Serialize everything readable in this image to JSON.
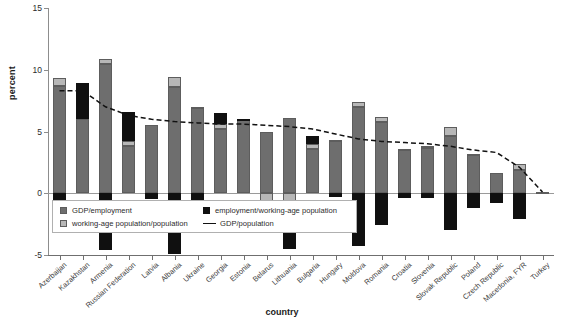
{
  "chart_data": {
    "type": "bar",
    "title": "",
    "subtitle": "",
    "xlabel": "country",
    "ylabel": "percent",
    "ylim": [
      -5,
      15
    ],
    "yticks": [
      -5,
      0,
      5,
      10,
      15
    ],
    "ytick_labels": [
      "-5",
      "0",
      "5",
      "10",
      "15"
    ],
    "grid": false,
    "stacked": true,
    "legend_position": "inside-lower-left",
    "categories": [
      "Azerbaijan",
      "Kazakhstan",
      "Armenia",
      "Russian Federation",
      "Latvia",
      "Albania",
      "Ukraine",
      "Georgia",
      "Estonia",
      "Belarus",
      "Lithuania",
      "Bulgaria",
      "Hungary",
      "Moldova",
      "Romania",
      "Croatia",
      "Slovenia",
      "Slovak Republic",
      "Poland",
      "Czech Republic",
      "Macedonia, FYR",
      "Turkey"
    ],
    "series": [
      {
        "name": "GDP/employment",
        "color": "#6e6e6e",
        "values": [
          8.7,
          6.0,
          10.5,
          3.8,
          5.5,
          8.6,
          6.9,
          5.2,
          5.9,
          5.0,
          6.1,
          3.6,
          4.2,
          7.0,
          5.8,
          3.5,
          3.7,
          4.6,
          3.1,
          1.6,
          1.9,
          0.0
        ]
      },
      {
        "name": "working-age population/population",
        "color": "#b7b7b7",
        "values": [
          0.6,
          0.0,
          0.4,
          0.4,
          0.0,
          0.8,
          0.1,
          0.4,
          0.0,
          -0.9,
          -0.6,
          0.4,
          0.1,
          0.4,
          0.4,
          0.1,
          0.1,
          0.8,
          0.1,
          0.0,
          0.5,
          0.1
        ]
      },
      {
        "name": "employment/working-age population",
        "color": "#101010",
        "values": [
          -1.3,
          2.9,
          -4.6,
          2.4,
          -0.5,
          -4.9,
          -2.8,
          0.9,
          0.1,
          -1.2,
          -3.9,
          0.6,
          -0.3,
          -4.3,
          -2.6,
          -0.4,
          -0.4,
          -3.0,
          -1.2,
          -0.8,
          -2.1,
          0.0
        ]
      }
    ],
    "line_series": {
      "name": "GDP/population",
      "color": "#111111",
      "style": "dashed",
      "values": [
        8.3,
        8.3,
        7.0,
        6.3,
        6.0,
        5.8,
        5.7,
        5.6,
        5.6,
        5.5,
        5.4,
        5.2,
        4.8,
        4.4,
        4.2,
        4.1,
        4.0,
        3.8,
        3.5,
        3.3,
        2.1,
        0.1
      ]
    }
  },
  "axes": {
    "y_label": "percent",
    "x_label": "country"
  },
  "legend": {
    "items": [
      {
        "label": "GDP/employment",
        "swatch": "gdpemp-swatch"
      },
      {
        "label": "employment/working-age population",
        "swatch": "empwap-swatch"
      },
      {
        "label": "working-age population/population",
        "swatch": "wap-swatch"
      },
      {
        "label": "GDP/population",
        "swatch": "line-swatch"
      }
    ]
  }
}
